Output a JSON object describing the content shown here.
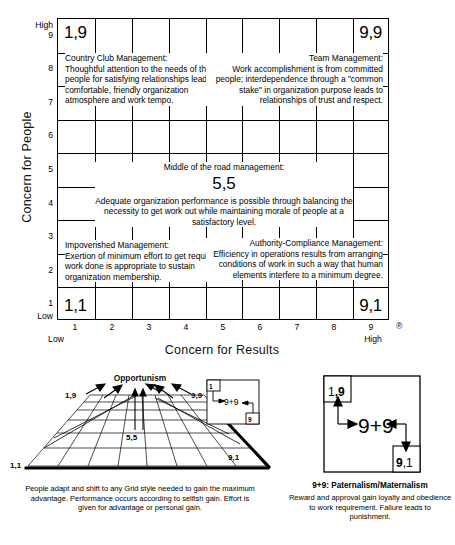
{
  "grid": {
    "y_axis_title": "Concern for People",
    "x_axis_title": "Concern for Results",
    "y_high_label": "High",
    "y_low_label": "Low",
    "x_low_label": "Low",
    "x_high_label": "High",
    "registered_mark": "®",
    "y_ticks": [
      "9",
      "8",
      "7",
      "6",
      "5",
      "4",
      "3",
      "2",
      "1"
    ],
    "x_ticks": [
      "1",
      "2",
      "3",
      "4",
      "5",
      "6",
      "7",
      "8",
      "9"
    ],
    "corners": {
      "top_left": "1,9",
      "top_right": "9,9",
      "bottom_left": "1,1",
      "bottom_right": "9,1"
    },
    "styles": {
      "country_club": {
        "title": "Country Club Management:",
        "body": "Thoughtful attention to the needs of the people for satisfying relationships leads to a comfortable, friendly organization atmosphere and work tempo."
      },
      "team": {
        "title": "Team Management:",
        "body": "Work accomplishment is from committed people; interdependence through a \"common stake\" in organization purpose leads to relationships of trust and respect."
      },
      "middle": {
        "title": "Middle of the road management:",
        "number": "5,5",
        "body": "Adequate organization performance is possible through balancing the necessity to get work out  while maintaining morale of people at a satisfactory level."
      },
      "impoverished": {
        "title": "Impoverished Management:",
        "body": "Exertion of minimum effort to get required work done is appropriate to sustain organization membership."
      },
      "authority_compliance": {
        "title": "Authority-Compliance Management:",
        "body": "Efficiency in operations results from arranging conditions of work in such a way that human elements interfere to a minimum degree."
      }
    }
  },
  "opportunism": {
    "title": "Opportunism",
    "labels": {
      "top_left": "1,9",
      "top_right": "9,9",
      "center": "5,5",
      "bottom_left": "1,1",
      "bottom_right": "9,1",
      "inset_top": "1",
      "inset_center": "9+9",
      "inset_bottom": "9"
    },
    "caption": "People adapt and shift to any Grid style needed to gain the maximum advantage. Performance occurs according to selfish gain. Effort is given for advantage or personal gain."
  },
  "paternalism": {
    "title": "9+9: Paternalism/Maternalism",
    "labels": {
      "top_left": "1,9",
      "center": "9+9",
      "bottom_right": "9,1"
    },
    "caption": "Reward and approval gain loyalty and obedience to work requirement. Failure leads to punishment."
  },
  "colors": {
    "ink": "#000000",
    "paper": "#ffffff"
  }
}
